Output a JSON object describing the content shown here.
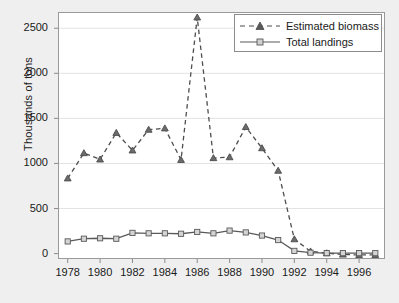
{
  "chart_data": {
    "type": "line",
    "title": "",
    "xlabel": "",
    "ylabel": "Thousands of tons",
    "xlim": [
      1977.4,
      1997.6
    ],
    "ylim": [
      -60,
      2680
    ],
    "grid": true,
    "grid_axis": "y",
    "legend_position": "top-right",
    "x": [
      1978,
      1979,
      1980,
      1981,
      1982,
      1983,
      1984,
      1985,
      1986,
      1987,
      1988,
      1989,
      1990,
      1991,
      1992,
      1993,
      1994,
      1995,
      1996,
      1997
    ],
    "xticks": [
      1978,
      1980,
      1982,
      1984,
      1986,
      1988,
      1990,
      1992,
      1994,
      1996
    ],
    "xtick_labels": [
      "1978",
      "1980",
      "1982",
      "1984",
      "1986",
      "1988",
      "1990",
      "1992",
      "1994",
      "1996"
    ],
    "yticks": [
      0,
      500,
      1000,
      1500,
      2000,
      2500
    ],
    "ytick_labels": [
      "0",
      "500",
      "1000",
      "1500",
      "2000",
      "2500"
    ],
    "series": [
      {
        "name": "Estimated biomass",
        "marker": "triangle",
        "linestyle": "dashed",
        "color": "#4d4d4d",
        "values": [
          835,
          1115,
          1045,
          1340,
          1145,
          1375,
          1390,
          1040,
          2620,
          1060,
          1070,
          1405,
          1170,
          920,
          160,
          25,
          5,
          -10,
          -15,
          -15
        ]
      },
      {
        "name": "Total landings",
        "marker": "square",
        "linestyle": "solid",
        "color": "#595959",
        "values": [
          135,
          165,
          170,
          165,
          230,
          225,
          225,
          220,
          240,
          225,
          255,
          235,
          200,
          150,
          30,
          10,
          5,
          5,
          5,
          5
        ]
      }
    ]
  },
  "legend": {
    "items": [
      {
        "label": "Estimated biomass"
      },
      {
        "label": "Total landings"
      }
    ]
  },
  "colors": {
    "background": "#efefef",
    "plot_background": "#ffffff",
    "axis": "#8c8c8c",
    "grid": "#e3e3e3",
    "biomass": "#4d4d4d",
    "landings": "#595959"
  }
}
